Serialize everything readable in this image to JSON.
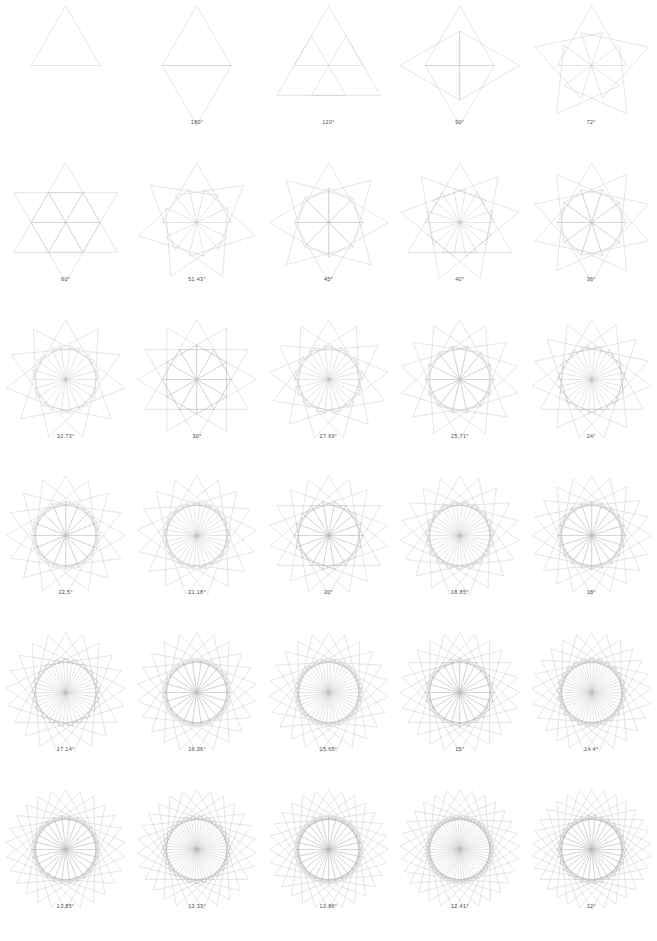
{
  "page": {
    "background_color": "#ffffff",
    "stroke_color": "#b9b9b9",
    "label_color": "#4a4a4a",
    "columns": 5,
    "rows": 6
  },
  "chart_data": {
    "type": "line",
    "subtitle": "",
    "xlabel": "",
    "ylabel": "",
    "grid": false,
    "legend_position": "none",
    "categories": [
      "360°",
      "180°",
      "120°",
      "90°",
      "72°",
      "60°",
      "51.43°",
      "45°",
      "40°",
      "36°",
      "32.73°",
      "30°",
      "27.69°",
      "25.71°",
      "24°",
      "22.5°",
      "21.18°",
      "20°",
      "18.85°",
      "18°",
      "17.14°",
      "16.36°",
      "15.65°",
      "15°",
      "14.4°",
      "13.85°",
      "13.33°",
      "12.86°",
      "12.41°",
      "12°"
    ],
    "values": [
      1,
      2,
      3,
      4,
      5,
      6,
      7,
      8,
      9,
      10,
      11,
      12,
      13,
      14,
      15,
      16,
      17,
      18,
      19,
      20,
      21,
      22,
      23,
      24,
      25,
      26,
      27,
      28,
      29,
      30
    ],
    "series": [
      {
        "name": "copies",
        "values": [
          1,
          2,
          3,
          4,
          5,
          6,
          7,
          8,
          9,
          10,
          11,
          12,
          13,
          14,
          15,
          16,
          17,
          18,
          19,
          20,
          21,
          22,
          23,
          24,
          25,
          26,
          27,
          28,
          29,
          30
        ]
      },
      {
        "name": "rotation_angle_degrees",
        "values": [
          360,
          180,
          120,
          90,
          72,
          60,
          51.43,
          45,
          40,
          36,
          32.73,
          30,
          27.69,
          25.71,
          24,
          22.5,
          21.18,
          20,
          18.85,
          18,
          17.14,
          16.36,
          15.65,
          15,
          14.4,
          13.85,
          13.33,
          12.86,
          12.41,
          12
        ]
      }
    ]
  },
  "cells": [
    {
      "id": "cell-1",
      "label": "",
      "angle": 360,
      "copies": 1,
      "row": 1,
      "col": 1
    },
    {
      "id": "cell-2",
      "label": "180°",
      "angle": 180,
      "copies": 2,
      "row": 1,
      "col": 2
    },
    {
      "id": "cell-3",
      "label": "120°",
      "angle": 120,
      "copies": 3,
      "row": 1,
      "col": 3
    },
    {
      "id": "cell-4",
      "label": "90°",
      "angle": 90,
      "copies": 4,
      "row": 1,
      "col": 4
    },
    {
      "id": "cell-5",
      "label": "72°",
      "angle": 72,
      "copies": 5,
      "row": 1,
      "col": 5
    },
    {
      "id": "cell-6",
      "label": "60°",
      "angle": 60,
      "copies": 6,
      "row": 2,
      "col": 1
    },
    {
      "id": "cell-7",
      "label": "51.43°",
      "angle": 51.43,
      "copies": 7,
      "row": 2,
      "col": 2
    },
    {
      "id": "cell-8",
      "label": "45°",
      "angle": 45,
      "copies": 8,
      "row": 2,
      "col": 3
    },
    {
      "id": "cell-9",
      "label": "40°",
      "angle": 40,
      "copies": 9,
      "row": 2,
      "col": 4
    },
    {
      "id": "cell-10",
      "label": "36°",
      "angle": 36,
      "copies": 10,
      "row": 2,
      "col": 5
    },
    {
      "id": "cell-11",
      "label": "32.73°",
      "angle": 32.73,
      "copies": 11,
      "row": 3,
      "col": 1
    },
    {
      "id": "cell-12",
      "label": "30°",
      "angle": 30,
      "copies": 12,
      "row": 3,
      "col": 2
    },
    {
      "id": "cell-13",
      "label": "27.69°",
      "angle": 27.69,
      "copies": 13,
      "row": 3,
      "col": 3
    },
    {
      "id": "cell-14",
      "label": "25.71°",
      "angle": 25.71,
      "copies": 14,
      "row": 3,
      "col": 4
    },
    {
      "id": "cell-15",
      "label": "24°",
      "angle": 24,
      "copies": 15,
      "row": 3,
      "col": 5
    },
    {
      "id": "cell-16",
      "label": "22.5°",
      "angle": 22.5,
      "copies": 16,
      "row": 4,
      "col": 1
    },
    {
      "id": "cell-17",
      "label": "21.18°",
      "angle": 21.18,
      "copies": 17,
      "row": 4,
      "col": 2
    },
    {
      "id": "cell-18",
      "label": "20°",
      "angle": 20,
      "copies": 18,
      "row": 4,
      "col": 3
    },
    {
      "id": "cell-19",
      "label": "18.85°",
      "angle": 18.85,
      "copies": 19,
      "row": 4,
      "col": 4
    },
    {
      "id": "cell-20",
      "label": "18°",
      "angle": 18,
      "copies": 20,
      "row": 4,
      "col": 5
    },
    {
      "id": "cell-21",
      "label": "17.14°",
      "angle": 17.14,
      "copies": 21,
      "row": 5,
      "col": 1
    },
    {
      "id": "cell-22",
      "label": "16.36°",
      "angle": 16.36,
      "copies": 22,
      "row": 5,
      "col": 2
    },
    {
      "id": "cell-23",
      "label": "15.65°",
      "angle": 15.65,
      "copies": 23,
      "row": 5,
      "col": 3
    },
    {
      "id": "cell-24",
      "label": "15°",
      "angle": 15,
      "copies": 24,
      "row": 5,
      "col": 4
    },
    {
      "id": "cell-25",
      "label": "14.4°",
      "angle": 14.4,
      "copies": 25,
      "row": 5,
      "col": 5
    },
    {
      "id": "cell-26",
      "label": "13.85°",
      "angle": 13.85,
      "copies": 26,
      "row": 6,
      "col": 1
    },
    {
      "id": "cell-27",
      "label": "13.33°",
      "angle": 13.33,
      "copies": 27,
      "row": 6,
      "col": 2
    },
    {
      "id": "cell-28",
      "label": "12.86°",
      "angle": 12.86,
      "copies": 28,
      "row": 6,
      "col": 3
    },
    {
      "id": "cell-29",
      "label": "12.41°",
      "angle": 12.41,
      "copies": 29,
      "row": 6,
      "col": 4
    },
    {
      "id": "cell-30",
      "label": "12°",
      "angle": 12,
      "copies": 30,
      "row": 6,
      "col": 5
    }
  ]
}
